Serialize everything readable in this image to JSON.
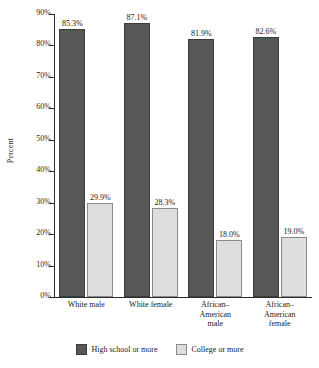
{
  "chart_data": {
    "type": "bar",
    "title": "",
    "xlabel": "",
    "ylabel": "Percent",
    "ylim": [
      0,
      90
    ],
    "ytick_labels": [
      "0%",
      "10%",
      "20%",
      "30%",
      "40%",
      "50%",
      "60%",
      "70%",
      "80%",
      "90%"
    ],
    "ytick_values": [
      0,
      10,
      20,
      30,
      40,
      50,
      60,
      70,
      80,
      90
    ],
    "grid": false,
    "legend_position": "bottom",
    "categories": [
      "White male",
      "White female",
      "African–American male",
      "African–American female"
    ],
    "category_lines": [
      [
        "White male"
      ],
      [
        "White female"
      ],
      [
        "African–",
        "American",
        "male"
      ],
      [
        "African–",
        "American",
        "female"
      ]
    ],
    "series": [
      {
        "name": "High school or more",
        "color": "#575757",
        "values": [
          85.3,
          87.1,
          81.9,
          82.6
        ],
        "labels": [
          "85.3%",
          "87.1%",
          "81.9%",
          "82.6%"
        ]
      },
      {
        "name": "College or more",
        "color": "#dedede",
        "values": [
          29.9,
          28.3,
          18.0,
          19.0
        ],
        "labels": [
          "29.9%",
          "28.3%",
          "18.0%",
          "19.0%"
        ]
      }
    ]
  },
  "legend": {
    "items": [
      {
        "label": "High school or more",
        "swatch": "dark"
      },
      {
        "label": "College or more",
        "swatch": "light"
      }
    ]
  }
}
